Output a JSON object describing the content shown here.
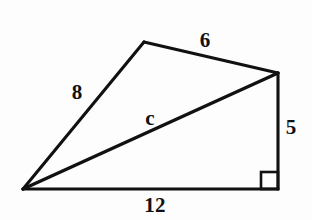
{
  "figure": {
    "kind": "geometry-diagram",
    "background_color": "#fdfdfd",
    "stroke_color": "#111111",
    "label_color": "#111111",
    "width": 312,
    "height": 220,
    "vertices": {
      "left": {
        "name": "left-vertex",
        "x": 23,
        "y": 189
      },
      "apex": {
        "name": "apex-vertex",
        "x": 144,
        "y": 42
      },
      "top_right": {
        "name": "top-right-vertex",
        "x": 278,
        "y": 73
      },
      "bottom_right": {
        "name": "bottom-right-vertex",
        "x": 278,
        "y": 189
      }
    },
    "edges": [
      {
        "id": "side-8",
        "from": "left",
        "to": "apex",
        "label": "8"
      },
      {
        "id": "side-6",
        "from": "apex",
        "to": "top_right",
        "label": "6"
      },
      {
        "id": "side-5",
        "from": "top_right",
        "to": "bottom_right",
        "label": "5"
      },
      {
        "id": "side-12",
        "from": "left",
        "to": "bottom_right",
        "label": "12"
      },
      {
        "id": "diagonal-c",
        "from": "left",
        "to": "top_right",
        "label": "c"
      }
    ],
    "right_angle": {
      "name": "right-angle-marker",
      "at_vertex": "bottom_right",
      "size": 17,
      "x": 261,
      "y": 172
    },
    "labels": {
      "side_8": {
        "text": "8",
        "x": 77,
        "y": 92
      },
      "side_6": {
        "text": "6",
        "x": 205,
        "y": 40
      },
      "diagonal_c": {
        "text": "c",
        "x": 150,
        "y": 118
      },
      "side_5": {
        "text": "5",
        "x": 291,
        "y": 127
      },
      "side_12": {
        "text": "12",
        "x": 155,
        "y": 205
      }
    }
  }
}
